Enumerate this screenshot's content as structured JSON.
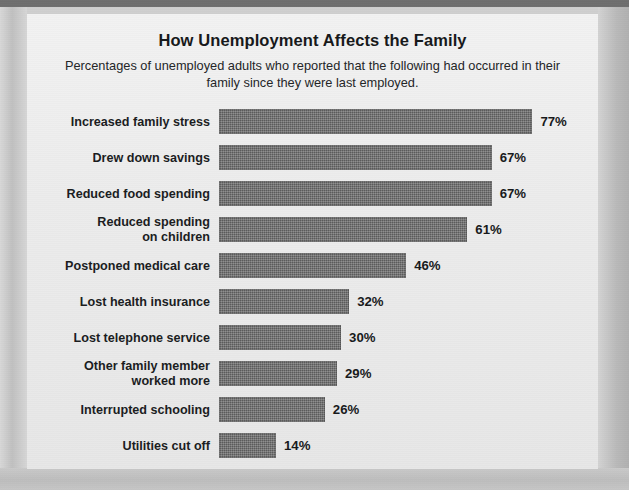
{
  "chart_data": {
    "type": "bar",
    "orientation": "horizontal",
    "title": "How Unemployment Affects the Family",
    "subtitle": "Percentages of unemployed adults who reported that the following had occurred in their family since they were last employed.",
    "xlabel": "",
    "ylabel": "",
    "xlim": [
      0,
      100
    ],
    "grid": false,
    "legend": null,
    "value_suffix": "%",
    "bar_color": "#6d6d6d",
    "background_color": "#ececec",
    "categories": [
      "Increased family stress",
      "Drew down savings",
      "Reduced food spending",
      "Reduced spending\non children",
      "Postponed medical care",
      "Lost health insurance",
      "Lost telephone service",
      "Other family member\nworked more",
      "Interrupted schooling",
      "Utilities cut off"
    ],
    "values": [
      77,
      67,
      67,
      61,
      46,
      32,
      30,
      29,
      26,
      14
    ],
    "value_labels": [
      "77%",
      "67%",
      "67%",
      "61%",
      "46%",
      "32%",
      "30%",
      "29%",
      "26%",
      "14%"
    ],
    "rows": [
      {
        "label": "Increased family stress",
        "value": 77,
        "value_label": "77%"
      },
      {
        "label": "Drew down savings",
        "value": 67,
        "value_label": "67%"
      },
      {
        "label": "Reduced food spending",
        "value": 67,
        "value_label": "67%"
      },
      {
        "label": "Reduced spending\non children",
        "value": 61,
        "value_label": "61%"
      },
      {
        "label": "Postponed medical care",
        "value": 46,
        "value_label": "46%"
      },
      {
        "label": "Lost health insurance",
        "value": 32,
        "value_label": "32%"
      },
      {
        "label": "Lost telephone service",
        "value": 30,
        "value_label": "30%"
      },
      {
        "label": "Other family member\nworked more",
        "value": 29,
        "value_label": "29%"
      },
      {
        "label": "Interrupted schooling",
        "value": 26,
        "value_label": "26%"
      },
      {
        "label": "Utilities cut off",
        "value": 14,
        "value_label": "14%"
      }
    ]
  }
}
